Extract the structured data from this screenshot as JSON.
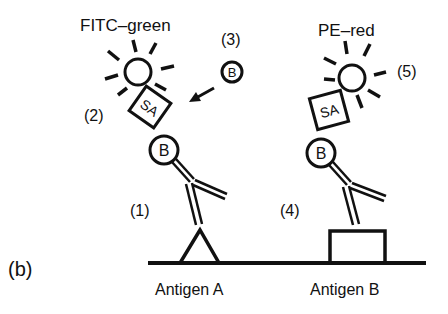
{
  "panel_label": "(b)",
  "labels": {
    "fitc": "FITC–green",
    "pe": "PE–red",
    "step1": "(1)",
    "step2": "(2)",
    "step3": "(3)",
    "step4": "(4)",
    "step5": "(5)",
    "sa": "SA",
    "biotin": "B",
    "antigen_a": "Antigen A",
    "antigen_b": "Antigen B"
  },
  "colors": {
    "ink": "#111111",
    "background": "#ffffff"
  }
}
